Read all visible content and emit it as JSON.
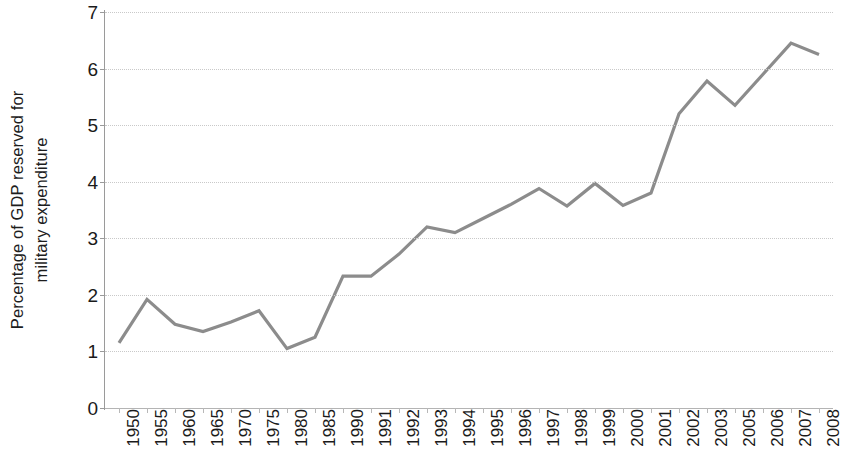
{
  "chart_data": {
    "type": "line",
    "title": "",
    "xlabel": "",
    "ylabel": "Percentage of GDP reserved for military expenditure",
    "ylabel_line1": "Percentage of GDP reserved for",
    "ylabel_line2": "military expenditure",
    "ylim": [
      0,
      7
    ],
    "y_ticks": [
      0,
      1,
      2,
      3,
      4,
      5,
      6,
      7
    ],
    "y_tick_labels": [
      "0",
      "1",
      "2",
      "3",
      "4",
      "5",
      "6",
      "7"
    ],
    "grid": true,
    "grid_axis": "y",
    "legend": "none",
    "line_color": "#8c8c8c",
    "line_width": 3.2,
    "categories": [
      "1950",
      "1955",
      "1960",
      "1965",
      "1970",
      "1975",
      "1980",
      "1985",
      "1990",
      "1991",
      "1992",
      "1993",
      "1994",
      "1995",
      "1996",
      "1997",
      "1998",
      "1999",
      "2000",
      "2001",
      "2002",
      "2003",
      "2005",
      "2006",
      "2007",
      "2008"
    ],
    "values": [
      1.15,
      1.92,
      1.48,
      1.35,
      1.52,
      1.72,
      1.05,
      1.25,
      2.33,
      2.33,
      2.72,
      3.2,
      3.1,
      3.35,
      3.6,
      3.88,
      3.57,
      3.97,
      3.58,
      3.8,
      5.2,
      5.78,
      5.35,
      5.9,
      6.45,
      6.25
    ],
    "series": [
      {
        "name": "Military expenditure as % of GDP",
        "color": "#8c8c8c",
        "values": [
          1.15,
          1.92,
          1.48,
          1.35,
          1.52,
          1.72,
          1.05,
          1.25,
          2.33,
          2.33,
          2.72,
          3.2,
          3.1,
          3.35,
          3.6,
          3.88,
          3.57,
          3.97,
          3.58,
          3.8,
          5.2,
          5.78,
          5.35,
          5.9,
          6.45,
          6.25
        ]
      }
    ]
  },
  "axis": {
    "y_title_line1": "Percentage of GDP reserved for",
    "y_title_line2": "military expenditure"
  }
}
